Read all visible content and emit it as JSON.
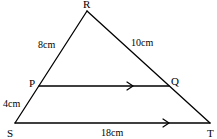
{
  "figure": {
    "points": {
      "R": "R",
      "P": "P",
      "Q": "Q",
      "S": "S",
      "T": "T"
    },
    "lengths": {
      "RP": "8cm",
      "RQ": "10cm",
      "PS": "4cm",
      "ST": "18cm"
    },
    "parallel_marks": [
      "PQ",
      "ST"
    ],
    "color": "#000000"
  }
}
